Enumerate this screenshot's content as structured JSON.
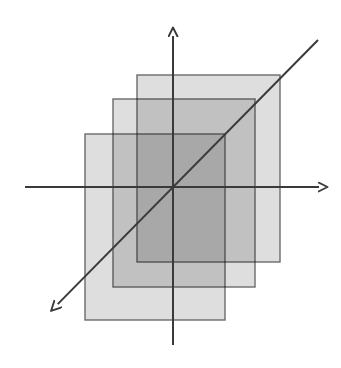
{
  "canvas": {
    "width": 341,
    "height": 368,
    "background": "#ffffff",
    "title": "Three overlapping translucent rectangles on a coordinate axis system"
  },
  "palette": {
    "stroke": "#595959",
    "axis_stroke": "#3a3a3a",
    "rect_fill": "#c9c9c9",
    "rect_fill_opacity": 0.62,
    "rect_stroke": "#6b6b6b",
    "single_layer_tone": "#dcdcdc",
    "double_layer_tone": "#c0c0c0",
    "triple_layer_tone": "#a8a8a8"
  },
  "axes": {
    "origin": {
      "x": 173,
      "y": 187
    },
    "x_axis": {
      "label": "x-axis",
      "start": {
        "x": 25,
        "y": 187
      },
      "end": {
        "x": 327,
        "y": 187
      },
      "arrowhead": "right",
      "stroke_width": 2.0
    },
    "y_axis": {
      "label": "y-axis",
      "start": {
        "x": 173,
        "y": 345
      },
      "end": {
        "x": 173,
        "y": 28
      },
      "arrowhead": "up",
      "stroke_width": 2.0
    },
    "diagonal_axis": {
      "label": "z-axis",
      "start": {
        "x": 318,
        "y": 40
      },
      "end": {
        "x": 50,
        "y": 312
      },
      "arrowhead": "down-left",
      "stroke_width": 2.0
    }
  },
  "rectangles": [
    {
      "name": "back-rectangle",
      "order": "back",
      "x": 137,
      "y": 75,
      "width": 143,
      "height": 187,
      "fill": "#c9c9c9",
      "fill_opacity": 0.62,
      "stroke": "#6b6b6b",
      "stroke_width": 1.4
    },
    {
      "name": "middle-rectangle",
      "order": "middle",
      "x": 113,
      "y": 99,
      "width": 142,
      "height": 188,
      "fill": "#c9c9c9",
      "fill_opacity": 0.62,
      "stroke": "#6b6b6b",
      "stroke_width": 1.4
    },
    {
      "name": "front-rectangle",
      "order": "front",
      "x": 85,
      "y": 134,
      "width": 140,
      "height": 186,
      "fill": "#c9c9c9",
      "fill_opacity": 0.62,
      "stroke": "#6b6b6b",
      "stroke_width": 1.4
    }
  ],
  "annotations": {
    "count_rectangles": 3,
    "overlap_regions": 3,
    "has_labels": false,
    "has_tick_marks": false,
    "has_gridlines": false,
    "has_legend": false,
    "has_text": false
  }
}
